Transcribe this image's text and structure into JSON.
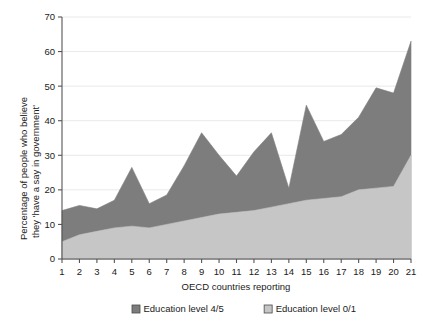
{
  "chart_data": {
    "type": "area",
    "stacked": true,
    "title": "",
    "xlabel": "OECD countries reporting",
    "ylabel": "Percentage of people who believe they 'have a say in government'",
    "categories": [
      "1",
      "2",
      "3",
      "4",
      "5",
      "6",
      "7",
      "8",
      "9",
      "10",
      "11",
      "12",
      "13",
      "14",
      "15",
      "16",
      "17",
      "18",
      "19",
      "20",
      "21"
    ],
    "x": [
      1,
      2,
      3,
      4,
      5,
      6,
      7,
      8,
      9,
      10,
      11,
      12,
      13,
      14,
      15,
      16,
      17,
      18,
      19,
      20,
      21
    ],
    "xlim": [
      1,
      21
    ],
    "ylim": [
      0,
      70
    ],
    "yticks": [
      0,
      10,
      20,
      30,
      40,
      50,
      60,
      70
    ],
    "xticks": [
      1,
      2,
      3,
      4,
      5,
      6,
      7,
      8,
      9,
      10,
      11,
      12,
      13,
      14,
      15,
      16,
      17,
      18,
      19,
      20,
      21
    ],
    "grid": "horizontal",
    "legend_position": "bottom",
    "series": [
      {
        "name": "Education level 0/1",
        "color": "#c6c6c6",
        "values": [
          5,
          7,
          8,
          9,
          9.5,
          9,
          10,
          11,
          12,
          13,
          13.5,
          14,
          15,
          16,
          17,
          17.5,
          18,
          20,
          20.5,
          21,
          30
        ]
      },
      {
        "name": "Education level 4/5",
        "color": "#7d7d7d",
        "values": [
          14,
          15.5,
          14.5,
          17,
          26.5,
          16,
          18.5,
          27,
          36.5,
          30,
          24,
          31,
          36.5,
          20.5,
          44.5,
          34,
          36,
          41,
          49.5,
          48,
          63
        ]
      }
    ]
  },
  "axis": {
    "y_tick_labels": [
      "0",
      "10",
      "20",
      "30",
      "40",
      "50",
      "60",
      "70"
    ],
    "x_tick_labels": [
      "1",
      "2",
      "3",
      "4",
      "5",
      "6",
      "7",
      "8",
      "9",
      "10",
      "11",
      "12",
      "13",
      "14",
      "15",
      "16",
      "17",
      "18",
      "19",
      "20",
      "21"
    ],
    "x_title": "OECD countries reporting",
    "y_title_line1": "Percentage of people who believe",
    "y_title_line2": "they 'have a say in government'"
  },
  "legend": {
    "items": [
      {
        "label": "Education level 4/5",
        "color": "#7d7d7d"
      },
      {
        "label": "Education level 0/1",
        "color": "#c6c6c6"
      }
    ]
  }
}
